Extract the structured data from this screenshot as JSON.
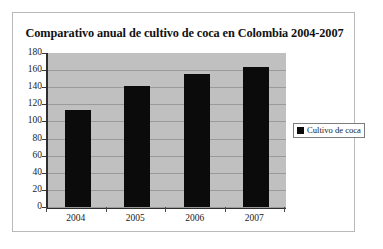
{
  "chart_data": {
    "type": "bar",
    "title": "Comparativo anual de cultivo de coca en Colombia 2004-2007",
    "categories": [
      "2004",
      "2005",
      "2006",
      "2007"
    ],
    "values": [
      113,
      142,
      155,
      164
    ],
    "series": [
      {
        "name": "Cultivo de coca",
        "values": [
          113,
          142,
          155,
          164
        ],
        "color": "#0b0b0b"
      }
    ],
    "xlabel": "",
    "ylabel": "",
    "ylim": [
      0,
      180
    ],
    "ytick_step": 20,
    "yticks": [
      "180",
      "160",
      "140",
      "120",
      "100",
      "80",
      "60",
      "40",
      "20",
      "0"
    ],
    "grid": true,
    "legend_position": "right",
    "legend_entries": [
      "Cultivo de coca"
    ],
    "plot_background": "#c0c0c0",
    "page_background": "#ffffff"
  },
  "legend": {
    "label": "Cultivo de coca"
  }
}
